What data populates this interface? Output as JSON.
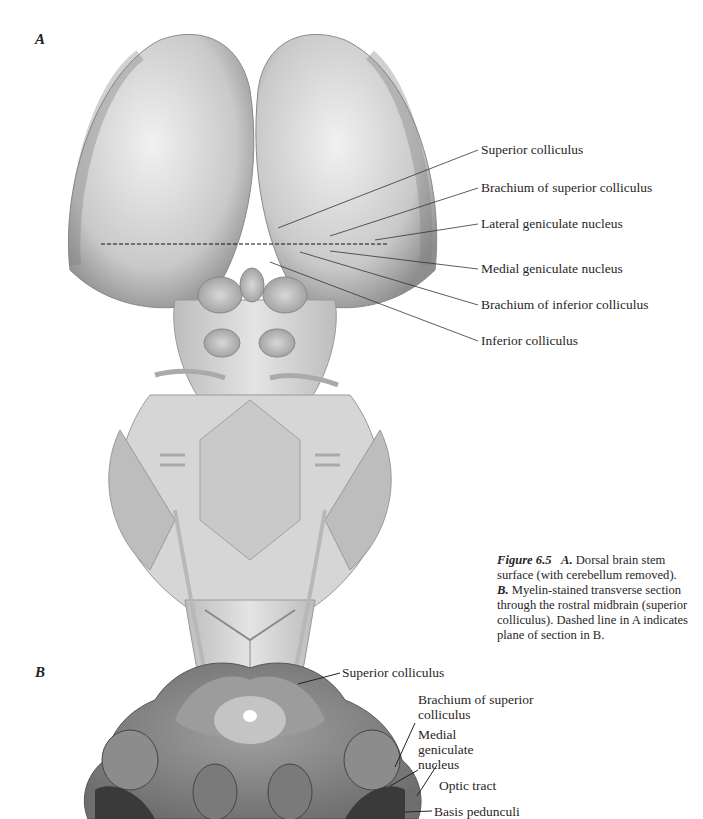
{
  "figure": {
    "panel_a_letter": "A",
    "panel_b_letter": "B",
    "panel_a_labels": [
      "Superior colliculus",
      "Brachium of superior colliculus",
      "Lateral geniculate nucleus",
      "Medial geniculate nucleus",
      "Brachium of inferior colliculus",
      "Inferior colliculus"
    ],
    "panel_b_labels": [
      "Superior colliculus",
      "Brachium of superior colliculus",
      "Medial geniculate nucleus",
      "Optic tract",
      "Basis pedunculi"
    ],
    "caption": {
      "figure_label": "Figure 6.5",
      "a_label": "A.",
      "a_text": "Dorsal brain stem surface (with cerebellum removed).",
      "b_label": "B.",
      "b_text": "Myelin-stained transverse section through the rostral midbrain (superior colliculus). Dashed line in A indicates plane of section in B."
    }
  }
}
